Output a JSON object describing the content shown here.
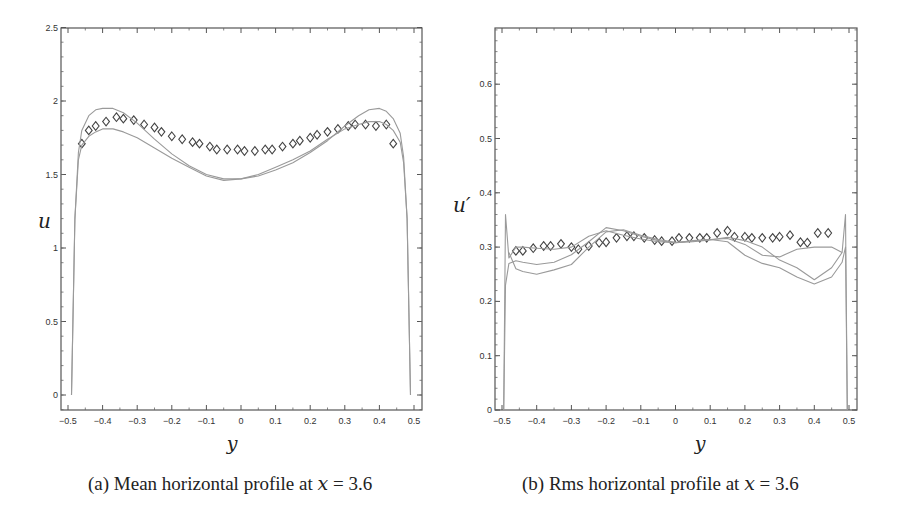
{
  "chart_data": [
    {
      "type": "line",
      "panel": "a",
      "title": "",
      "caption": "(a) Mean horizontal profile at x = 3.6",
      "caption_prefix": "(a) Mean horizontal profile at ",
      "caption_var": "x",
      "caption_suffix": " = 3.6",
      "xlabel": "y",
      "ylabel": "u",
      "xlim": [
        -0.52,
        0.52
      ],
      "ylim": [
        -0.1,
        2.5
      ],
      "xticks": [
        -0.5,
        -0.4,
        -0.3,
        -0.2,
        -0.1,
        0,
        0.1,
        0.2,
        0.3,
        0.4,
        0.5
      ],
      "xtick_labels": [
        "−0.5",
        "−0.4",
        "−0.3",
        "−0.2",
        "−0.1",
        "0",
        "0.1",
        "0.2",
        "0.3",
        "0.4",
        "0.5"
      ],
      "yticks": [
        0,
        0.5,
        1,
        1.5,
        2,
        2.5
      ],
      "ytick_labels": [
        "0",
        "0.5",
        "1",
        "1.5",
        "2",
        "2.5"
      ],
      "grid": false,
      "legend": null,
      "series": [
        {
          "name": "experimental (diamonds)",
          "style": "markers-diamond",
          "x": [
            -0.46,
            -0.44,
            -0.42,
            -0.39,
            -0.36,
            -0.34,
            -0.31,
            -0.28,
            -0.25,
            -0.23,
            -0.2,
            -0.17,
            -0.14,
            -0.12,
            -0.09,
            -0.07,
            -0.04,
            -0.01,
            0.01,
            0.04,
            0.07,
            0.09,
            0.12,
            0.15,
            0.17,
            0.2,
            0.22,
            0.25,
            0.28,
            0.31,
            0.33,
            0.36,
            0.39,
            0.42,
            0.44
          ],
          "y": [
            1.71,
            1.8,
            1.83,
            1.86,
            1.89,
            1.88,
            1.87,
            1.84,
            1.82,
            1.79,
            1.76,
            1.74,
            1.72,
            1.71,
            1.69,
            1.67,
            1.67,
            1.67,
            1.66,
            1.66,
            1.67,
            1.67,
            1.69,
            1.71,
            1.73,
            1.75,
            1.77,
            1.79,
            1.81,
            1.83,
            1.84,
            1.84,
            1.83,
            1.84,
            1.71
          ]
        },
        {
          "name": "simulation 1 (upper curve)",
          "style": "line",
          "x": [
            -0.49,
            -0.48,
            -0.47,
            -0.46,
            -0.44,
            -0.42,
            -0.4,
            -0.37,
            -0.34,
            -0.3,
            -0.25,
            -0.2,
            -0.15,
            -0.1,
            -0.05,
            0,
            0.05,
            0.1,
            0.15,
            0.2,
            0.25,
            0.3,
            0.34,
            0.37,
            0.4,
            0.42,
            0.44,
            0.46,
            0.47,
            0.48,
            0.49
          ],
          "y": [
            0.0,
            1.2,
            1.65,
            1.8,
            1.9,
            1.94,
            1.95,
            1.95,
            1.92,
            1.85,
            1.74,
            1.64,
            1.56,
            1.5,
            1.47,
            1.47,
            1.49,
            1.53,
            1.58,
            1.65,
            1.73,
            1.83,
            1.9,
            1.94,
            1.95,
            1.93,
            1.88,
            1.78,
            1.62,
            1.2,
            0.0
          ]
        },
        {
          "name": "simulation 2 (lower curve)",
          "style": "line",
          "x": [
            -0.49,
            -0.48,
            -0.47,
            -0.46,
            -0.44,
            -0.42,
            -0.4,
            -0.37,
            -0.34,
            -0.3,
            -0.25,
            -0.2,
            -0.15,
            -0.1,
            -0.05,
            0,
            0.05,
            0.1,
            0.15,
            0.2,
            0.25,
            0.3,
            0.34,
            0.37,
            0.4,
            0.42,
            0.44,
            0.46,
            0.47,
            0.48,
            0.49
          ],
          "y": [
            0.0,
            1.2,
            1.6,
            1.7,
            1.76,
            1.79,
            1.81,
            1.81,
            1.79,
            1.75,
            1.68,
            1.61,
            1.55,
            1.49,
            1.46,
            1.47,
            1.5,
            1.55,
            1.6,
            1.66,
            1.74,
            1.81,
            1.84,
            1.86,
            1.86,
            1.84,
            1.8,
            1.72,
            1.58,
            1.2,
            0.0
          ]
        }
      ]
    },
    {
      "type": "line",
      "panel": "b",
      "title": "",
      "caption": "(b) Rms horizontal profile at x = 3.6",
      "caption_prefix": "(b) Rms horizontal profile at ",
      "caption_var": "x",
      "caption_suffix": " = 3.6",
      "xlabel": "y",
      "ylabel": "u′",
      "xlim": [
        -0.52,
        0.52
      ],
      "ylim": [
        0,
        0.7
      ],
      "xticks": [
        -0.5,
        -0.4,
        -0.3,
        -0.2,
        -0.1,
        0,
        0.1,
        0.2,
        0.3,
        0.4,
        0.5
      ],
      "xtick_labels": [
        "−0.5",
        "−0.4",
        "−0.3",
        "−0.2",
        "−0.1",
        "0",
        "0.1",
        "0.2",
        "0.3",
        "0.4",
        "0.5"
      ],
      "yticks": [
        0,
        0.1,
        0.2,
        0.3,
        0.4,
        0.5,
        0.6
      ],
      "ytick_labels": [
        "0",
        "0.1",
        "0.2",
        "0.3",
        "0.4",
        "0.5",
        "0.6"
      ],
      "grid": false,
      "legend": null,
      "series": [
        {
          "name": "experimental (diamonds)",
          "style": "markers-diamond",
          "x": [
            -0.46,
            -0.44,
            -0.41,
            -0.38,
            -0.36,
            -0.33,
            -0.3,
            -0.28,
            -0.25,
            -0.22,
            -0.2,
            -0.17,
            -0.14,
            -0.12,
            -0.09,
            -0.06,
            -0.04,
            -0.01,
            0.01,
            0.04,
            0.07,
            0.09,
            0.12,
            0.15,
            0.17,
            0.2,
            0.22,
            0.25,
            0.28,
            0.3,
            0.33,
            0.36,
            0.38,
            0.41,
            0.44
          ],
          "y": [
            0.293,
            0.293,
            0.298,
            0.302,
            0.302,
            0.306,
            0.3,
            0.296,
            0.302,
            0.308,
            0.309,
            0.317,
            0.32,
            0.32,
            0.317,
            0.313,
            0.311,
            0.311,
            0.317,
            0.317,
            0.317,
            0.317,
            0.326,
            0.33,
            0.319,
            0.319,
            0.317,
            0.317,
            0.317,
            0.319,
            0.322,
            0.309,
            0.308,
            0.326,
            0.326
          ]
        },
        {
          "name": "simulation 1",
          "style": "line",
          "x": [
            -0.495,
            -0.49,
            -0.48,
            -0.46,
            -0.44,
            -0.4,
            -0.35,
            -0.3,
            -0.25,
            -0.2,
            -0.15,
            -0.1,
            -0.05,
            0,
            0.05,
            0.1,
            0.15,
            0.2,
            0.25,
            0.3,
            0.35,
            0.4,
            0.45,
            0.48,
            0.49,
            0.495
          ],
          "y": [
            0.0,
            0.36,
            0.28,
            0.3,
            0.3,
            0.298,
            0.296,
            0.3,
            0.32,
            0.33,
            0.322,
            0.315,
            0.31,
            0.308,
            0.31,
            0.313,
            0.318,
            0.312,
            0.3,
            0.276,
            0.262,
            0.24,
            0.262,
            0.29,
            0.36,
            0.0
          ]
        },
        {
          "name": "simulation 2",
          "style": "line",
          "x": [
            -0.495,
            -0.49,
            -0.48,
            -0.46,
            -0.44,
            -0.4,
            -0.35,
            -0.3,
            -0.25,
            -0.2,
            -0.15,
            -0.1,
            -0.05,
            0,
            0.05,
            0.1,
            0.15,
            0.2,
            0.25,
            0.3,
            0.35,
            0.4,
            0.45,
            0.48,
            0.49,
            0.495
          ],
          "y": [
            0.0,
            0.23,
            0.27,
            0.275,
            0.272,
            0.268,
            0.272,
            0.286,
            0.31,
            0.336,
            0.33,
            0.32,
            0.312,
            0.308,
            0.312,
            0.314,
            0.31,
            0.285,
            0.27,
            0.262,
            0.245,
            0.232,
            0.245,
            0.272,
            0.3,
            0.0
          ]
        },
        {
          "name": "simulation 3",
          "style": "line",
          "x": [
            -0.48,
            -0.46,
            -0.44,
            -0.4,
            -0.35,
            -0.3,
            -0.25,
            -0.2,
            -0.15,
            -0.1,
            -0.05,
            0,
            0.05,
            0.1,
            0.15,
            0.2,
            0.25,
            0.3,
            0.35,
            0.4,
            0.45,
            0.48
          ],
          "y": [
            0.29,
            0.26,
            0.255,
            0.25,
            0.258,
            0.268,
            0.3,
            0.328,
            0.332,
            0.322,
            0.314,
            0.309,
            0.311,
            0.314,
            0.316,
            0.305,
            0.285,
            0.282,
            0.296,
            0.3,
            0.3,
            0.29
          ]
        }
      ]
    }
  ]
}
